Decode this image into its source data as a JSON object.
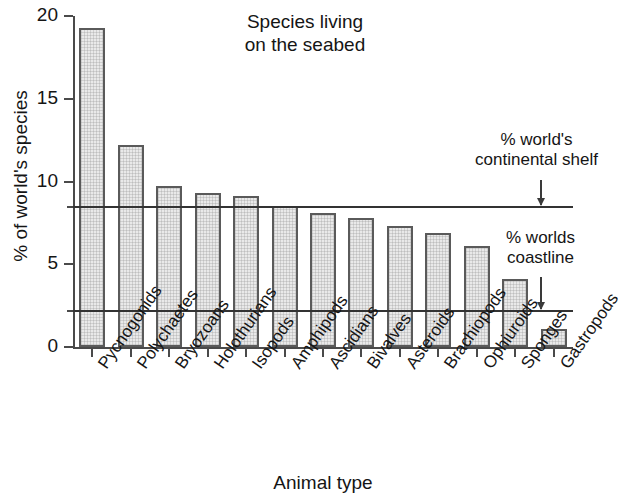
{
  "chart_data": {
    "type": "bar",
    "title": "Species living\non the seabed",
    "xlabel": "Animal type",
    "ylabel": "% of world's species",
    "ylim": [
      0,
      20
    ],
    "yticks": [
      0,
      5,
      10,
      15,
      20
    ],
    "ytick_labels": [
      "0",
      "5",
      "10",
      "15",
      "20"
    ],
    "grid": false,
    "legend": "none",
    "categories": [
      "Pycnogonids",
      "Polychaetes",
      "Bryozoans",
      "Holothurians",
      "Isopods",
      "Amphipods",
      "Ascidians",
      "Bivalves",
      "Asteroids",
      "Brachiopods",
      "Ophiuroids",
      "Sponges",
      "Gastropods"
    ],
    "values": [
      19.3,
      12.2,
      9.7,
      9.3,
      9.1,
      8.5,
      8.1,
      7.8,
      7.3,
      6.9,
      6.1,
      4.1,
      1.1
    ],
    "reference_lines": [
      {
        "id": "continental-shelf",
        "value": 8.45,
        "label": "% world's\ncontinental shelf"
      },
      {
        "id": "coastline",
        "value": 2.2,
        "label": "% worlds\ncoastline"
      }
    ],
    "colors": {
      "bar_fill": "#e9e9e9",
      "bar_edge": "#5a5a5a",
      "axis": "#4a4a4a",
      "reference_line": "#333333",
      "text": "#151515",
      "background": "#ffffff"
    }
  }
}
